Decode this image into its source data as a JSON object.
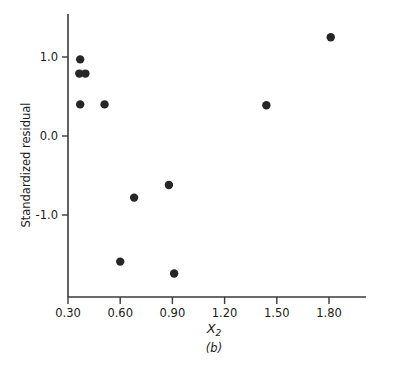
{
  "figure": {
    "panel_label": "(b)",
    "background": "#ffffff",
    "point_color": "#262626",
    "axis_color": "#3a3a3a"
  },
  "chart_data": {
    "type": "scatter",
    "title": "",
    "subtitle": "",
    "xlabel": "X2",
    "xlabel_base": "X",
    "xlabel_sub": "2",
    "ylabel": "Standardized residual",
    "xlim": [
      0.22,
      2.0
    ],
    "ylim": [
      -1.95,
      1.5
    ],
    "xticks": [
      0.3,
      0.6,
      0.9,
      1.2,
      1.5,
      1.8
    ],
    "xticklabels": [
      "0.30",
      "0.60",
      "0.90",
      "1.20",
      "1.50",
      "1.80"
    ],
    "yticks": [
      1.0,
      0.0,
      -1.0
    ],
    "yticklabels": [
      "1.0",
      "0.0",
      "-1.0"
    ],
    "grid": false,
    "legend": null,
    "marker": "filled-circle",
    "marker_size": 4.2,
    "x": [
      0.37,
      0.365,
      0.4,
      0.37,
      0.51,
      0.68,
      0.88,
      0.6,
      0.91,
      1.44,
      1.81
    ],
    "y": [
      0.97,
      0.79,
      0.79,
      0.4,
      0.4,
      -0.78,
      -0.62,
      -1.59,
      -1.74,
      0.39,
      1.25
    ],
    "points": [
      {
        "x": 0.37,
        "y": 0.97
      },
      {
        "x": 0.365,
        "y": 0.79
      },
      {
        "x": 0.4,
        "y": 0.79
      },
      {
        "x": 0.37,
        "y": 0.4
      },
      {
        "x": 0.51,
        "y": 0.4
      },
      {
        "x": 0.68,
        "y": -0.78
      },
      {
        "x": 0.88,
        "y": -0.62
      },
      {
        "x": 0.6,
        "y": -1.59
      },
      {
        "x": 0.91,
        "y": -1.74
      },
      {
        "x": 1.44,
        "y": 0.39
      },
      {
        "x": 1.81,
        "y": 1.25
      }
    ]
  }
}
